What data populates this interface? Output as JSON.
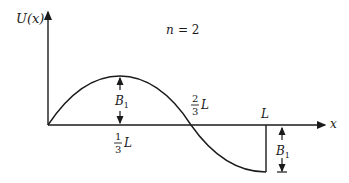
{
  "diagram": {
    "title": "n = 2",
    "title_n": "n",
    "title_eq": "= 2",
    "y_axis_label": "U(x)",
    "x_axis_label": "x",
    "labels": {
      "amplitude_top": "B",
      "amplitude_top_sub": "1",
      "amplitude_bottom": "B",
      "amplitude_bottom_sub": "1",
      "one_third_num": "1",
      "one_third_den": "3",
      "one_third_L": "L",
      "two_thirds_num": "2",
      "two_thirds_den": "3",
      "two_thirds_L": "L",
      "end_L": "L"
    },
    "curve": "sinusoidal mode shape, positive hump peaking at L/3, zero crossing at 2L/3, negative at L with vertical drop to axis",
    "color": "#1a1a1a"
  }
}
